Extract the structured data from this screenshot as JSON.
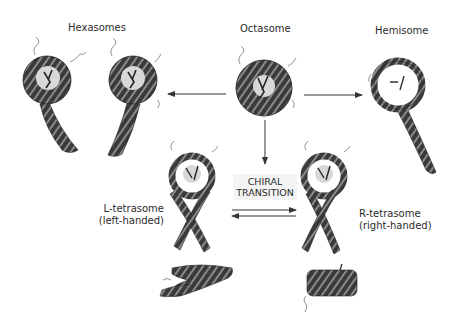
{
  "labels": {
    "hexasomes": "Hexasomes",
    "octasome": "Octasome",
    "hemisome": "Hemisome",
    "chiral_line1": "CHIRAL",
    "chiral_line2": "TRANSITION",
    "l_tetrasome_line1": "L-tetrasome",
    "l_tetrasome_line2": "(left-handed)",
    "r_tetrasome_line1": "R-tetrasome",
    "r_tetrasome_line2": "(right-handed)"
  },
  "structures": [
    {
      "name": "hexasome-1",
      "type": "nucleosome-with-tail",
      "tail": "down-right"
    },
    {
      "name": "hexasome-2",
      "type": "nucleosome-with-tail",
      "tail": "down-left"
    },
    {
      "name": "octasome",
      "type": "nucleosome"
    },
    {
      "name": "hemisome",
      "type": "nucleosome-with-tail",
      "tail": "down-right"
    },
    {
      "name": "l-tetrasome",
      "type": "crossed-tails"
    },
    {
      "name": "r-tetrasome",
      "type": "crossed-tails"
    },
    {
      "name": "l-tetrasome-side-view",
      "type": "side-view"
    },
    {
      "name": "r-tetrasome-side-view",
      "type": "side-view"
    }
  ],
  "arrows": [
    {
      "from": "octasome",
      "to": "hexasomes",
      "direction": "left"
    },
    {
      "from": "octasome",
      "to": "hemisome",
      "direction": "right"
    },
    {
      "from": "octasome",
      "to": "tetrasomes",
      "direction": "down"
    },
    {
      "from": "l-tetrasome",
      "to": "r-tetrasome",
      "direction": "bidirectional"
    }
  ],
  "colors": {
    "dna": "#3a3a3a",
    "dna_highlight": "#8a8a8a",
    "core": "#d8d8d8",
    "arrow": "#333333",
    "background": "#ffffff"
  }
}
